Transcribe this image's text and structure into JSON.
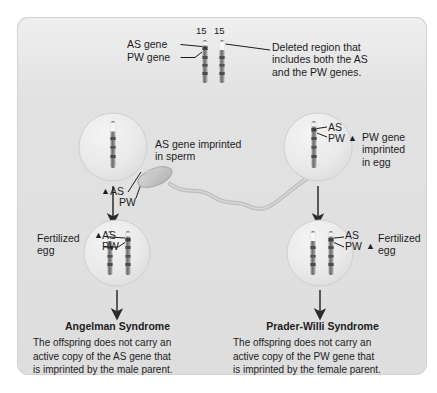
{
  "figure": {
    "type": "biology-diagram",
    "panel_background": "#e2e2e2",
    "page_background": "#ffffff"
  },
  "top": {
    "chromosome_number_left": "15",
    "chromosome_number_right": "15",
    "label_as_gene": "AS gene",
    "label_pw_gene": "PW gene",
    "callout_deleted_region": "Deleted region that\nincludes both the AS\nand the PW genes."
  },
  "middle": {
    "left_gamete": {
      "marker_triangle": "▲",
      "label_as": "AS",
      "label_pw": "PW"
    },
    "sperm_callout": "AS gene imprinted\nin sperm",
    "right_gamete": {
      "label_as": "AS",
      "label_pw": "PW",
      "marker_triangle": "▲"
    },
    "egg_callout": "PW gene\nimprinted\nin egg"
  },
  "zygotes": {
    "left": {
      "label": "Fertilized\negg",
      "marker_triangle": "▲",
      "label_as": "AS",
      "label_pw": "PW"
    },
    "right": {
      "label": "Fertilized\negg",
      "label_as": "AS",
      "label_pw": "PW",
      "marker_triangle": "▲"
    }
  },
  "outcomes": {
    "left": {
      "title": "Angelman Syndrome",
      "text": "The offspring does not carry an\nactive copy of the AS gene that\nis imprinted by the male parent."
    },
    "right": {
      "title": "Prader-Willi Syndrome",
      "text": "The offspring does not carry an\nactive copy of the PW gene that\nis imprinted by the female parent."
    }
  },
  "colors": {
    "chromosome_body": "#8b8b8b",
    "chromosome_dark_band": "#4a4a4a",
    "deleted_band": "#f5f5f5",
    "cell_fill": "#eaeaea",
    "text": "#1c1c1c"
  }
}
